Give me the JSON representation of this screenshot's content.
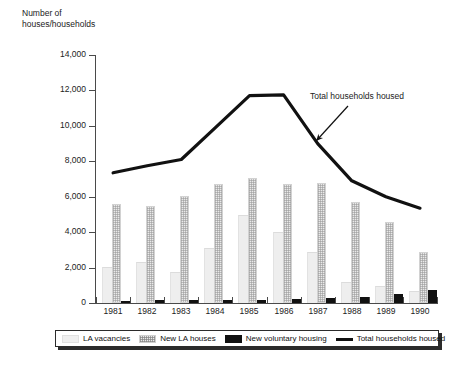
{
  "chart_data": {
    "type": "bar",
    "title": "Number of\nhouses/households",
    "xlabel": "",
    "ylabel": "Number of houses/households",
    "ylim": [
      0,
      14000
    ],
    "ytick_step": 2000,
    "yticks": [
      "0",
      "2,000",
      "4,000",
      "6,000",
      "8,000",
      "10,000",
      "12,000",
      "14,000"
    ],
    "ytick_values": [
      0,
      2000,
      4000,
      6000,
      8000,
      10000,
      12000,
      14000
    ],
    "grid": false,
    "legend_position": "bottom",
    "categories": [
      "1981",
      "1982",
      "1983",
      "1984",
      "1985",
      "1986",
      "1987",
      "1988",
      "1989",
      "1990"
    ],
    "series": [
      {
        "name": "LA vacancies",
        "type": "bar",
        "values": [
          2000,
          2250,
          1700,
          3050,
          4900,
          3950,
          2800,
          1150,
          900,
          650
        ]
      },
      {
        "name": "New LA houses",
        "type": "bar",
        "values": [
          5600,
          5450,
          6050,
          6700,
          7050,
          6700,
          6750,
          5700,
          4550,
          2900
        ]
      },
      {
        "name": "New voluntary housing",
        "type": "bar",
        "values": [
          120,
          150,
          190,
          170,
          160,
          210,
          300,
          330,
          520,
          760
        ]
      },
      {
        "name": "Total households housed",
        "type": "line",
        "values": [
          7350,
          7750,
          8100,
          9900,
          11700,
          11750,
          9000,
          6900,
          6000,
          5350
        ]
      }
    ],
    "annotations": [
      {
        "text": "Total households housed",
        "target_series": "Total households housed",
        "arrow": "down-left"
      }
    ]
  },
  "legend": {
    "items": [
      {
        "label": "LA vacancies",
        "swatch": "light-gray-bar-swatch"
      },
      {
        "label": "New LA houses",
        "swatch": "hatched-bar-swatch"
      },
      {
        "label": "New voluntary housing",
        "swatch": "black-bar-swatch"
      },
      {
        "label": "Total households housed",
        "swatch": "black-line-swatch"
      }
    ]
  }
}
